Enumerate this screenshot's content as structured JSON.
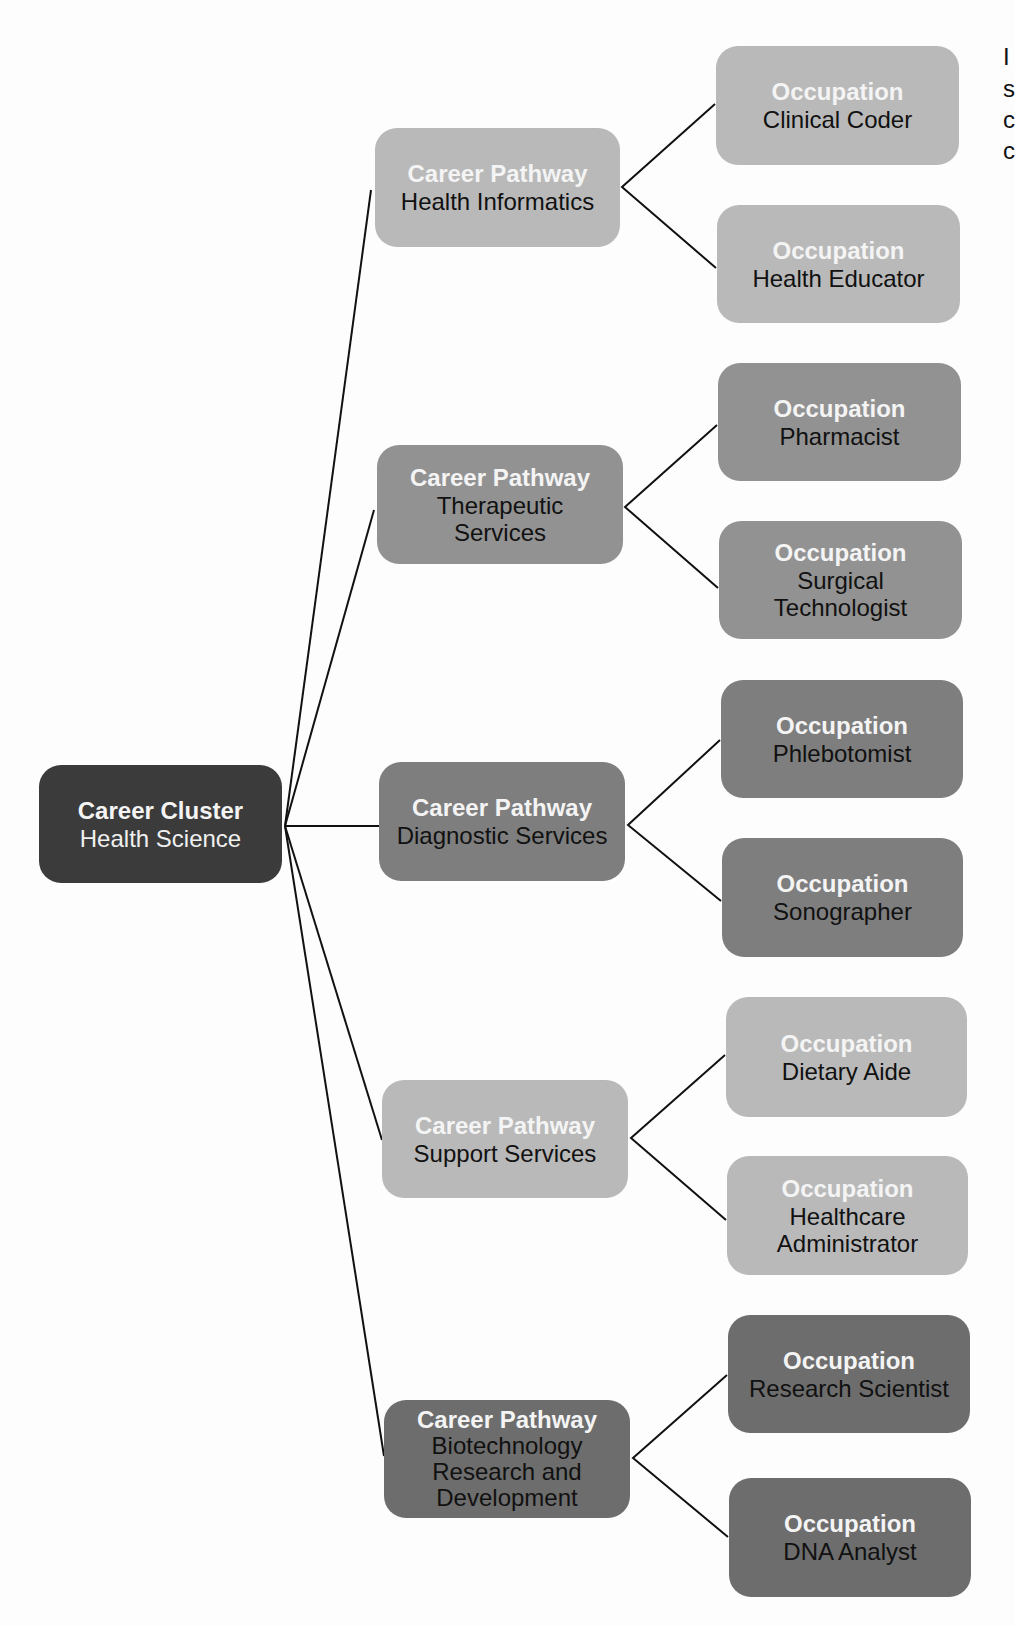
{
  "colors": {
    "cluster": "#3b3b3b",
    "health_informatics": "#b9b9b9",
    "therapeutic_services": "#929292",
    "diagnostic_services": "#7e7e7e",
    "support_services": "#b9b9b9",
    "biotechnology": "#6d6d6d",
    "connector": "#111111",
    "background": "#fdfdfd"
  },
  "cluster": {
    "kind": "Career Cluster",
    "name": "Health Science"
  },
  "pathways": [
    {
      "kind": "Career Pathway",
      "name": "Health Informatics",
      "occupations": [
        {
          "kind": "Occupation",
          "name": "Clinical Coder"
        },
        {
          "kind": "Occupation",
          "name": "Health Educator"
        }
      ]
    },
    {
      "kind": "Career Pathway",
      "name": "Therapeutic Services",
      "occupations": [
        {
          "kind": "Occupation",
          "name": "Pharmacist"
        },
        {
          "kind": "Occupation",
          "name": "Surgical Technologist"
        }
      ]
    },
    {
      "kind": "Career Pathway",
      "name": "Diagnostic Services",
      "occupations": [
        {
          "kind": "Occupation",
          "name": "Phlebotomist"
        },
        {
          "kind": "Occupation",
          "name": "Sonographer"
        }
      ]
    },
    {
      "kind": "Career Pathway",
      "name": "Support Services",
      "occupations": [
        {
          "kind": "Occupation",
          "name": "Dietary Aide"
        },
        {
          "kind": "Occupation",
          "name": "Healthcare Administrator"
        }
      ]
    },
    {
      "kind": "Career Pathway",
      "name": "Biotechnology Research and Development",
      "occupations": [
        {
          "kind": "Occupation",
          "name": "Research Scientist"
        },
        {
          "kind": "Occupation",
          "name": "DNA Analyst"
        }
      ]
    }
  ],
  "edge_text_fragments": [
    "I",
    "s",
    "c",
    "c"
  ]
}
